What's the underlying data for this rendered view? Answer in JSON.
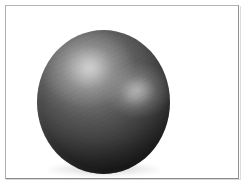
{
  "image": {
    "subject": "sphere",
    "subject_label": "gray sphere",
    "background_label": "white background",
    "surface_finish": "matte with specular highlights",
    "width_px": 246,
    "height_px": 188
  },
  "frame": {
    "name": "photo border",
    "border_color": "#9a9a9a",
    "inset_px": 5,
    "fill_color": "#ffffff"
  },
  "canvas": {
    "background_color": "#ffffff"
  },
  "sphere": {
    "center_x_px": 102,
    "center_y_px": 96,
    "width_px": 133,
    "height_px": 144,
    "base_color": "#4a4a4a",
    "shadow_color": "#141414",
    "midtone_color": "#646464",
    "top_px": 24,
    "left_px": 31
  },
  "highlights": [
    {
      "name": "primary-specular-highlight",
      "position": "upper-left",
      "color": "#d6d6d6",
      "center_x_px": 82,
      "center_y_px": 61
    },
    {
      "name": "secondary-specular-highlight",
      "position": "right-of-center",
      "color": "#c4c4c4",
      "center_x_px": 133,
      "center_y_px": 86
    }
  ],
  "contact_shadow": {
    "name": "contact-shadow",
    "color": "#000000",
    "opacity": 0.2
  }
}
